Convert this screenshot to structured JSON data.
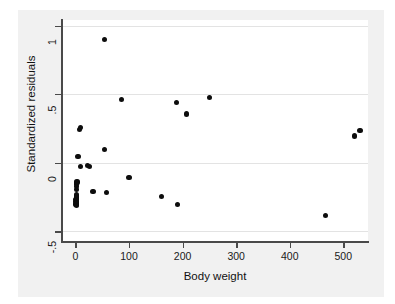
{
  "chart_data": {
    "type": "scatter",
    "title": "",
    "xlabel": "Body weight",
    "ylabel": "Standardized residuals",
    "xlim": [
      -25,
      546
    ],
    "ylim": [
      -0.57,
      1.04
    ],
    "xticks": [
      0,
      100,
      200,
      300,
      400,
      500
    ],
    "xtick_labels": [
      "0",
      "100",
      "200",
      "300",
      "400",
      "500"
    ],
    "yticks": [
      -0.5,
      0,
      0.5,
      1
    ],
    "ytick_labels": [
      "-.5",
      "0",
      ".5",
      "1"
    ],
    "grid": "horizontal",
    "legend": "none",
    "marker": "filled-circle",
    "marker_color": "#0d0d0d",
    "points": [
      {
        "x": 1,
        "y": -0.27
      },
      {
        "x": 1,
        "y": -0.28
      },
      {
        "x": 1.5,
        "y": -0.25
      },
      {
        "x": 1.5,
        "y": -0.255
      },
      {
        "x": 2,
        "y": -0.245
      },
      {
        "x": 2,
        "y": -0.26
      },
      {
        "x": 2.5,
        "y": -0.235
      },
      {
        "x": 1.2,
        "y": -0.3
      },
      {
        "x": 2.2,
        "y": -0.29
      },
      {
        "x": 1.8,
        "y": -0.31
      },
      {
        "x": 2.0,
        "y": -0.155
      },
      {
        "x": 2.2,
        "y": -0.175
      },
      {
        "x": 2.5,
        "y": -0.195
      },
      {
        "x": 3.0,
        "y": -0.14
      },
      {
        "x": 5,
        "y": 0.045
      },
      {
        "x": 7,
        "y": 0.245
      },
      {
        "x": 9,
        "y": 0.255
      },
      {
        "x": 10,
        "y": -0.03
      },
      {
        "x": 22,
        "y": -0.02
      },
      {
        "x": 26,
        "y": -0.025
      },
      {
        "x": 33,
        "y": -0.21
      },
      {
        "x": 54,
        "y": 0.9
      },
      {
        "x": 55,
        "y": 0.095
      },
      {
        "x": 58,
        "y": -0.215
      },
      {
        "x": 86,
        "y": 0.46
      },
      {
        "x": 100,
        "y": -0.105
      },
      {
        "x": 160,
        "y": -0.245
      },
      {
        "x": 189,
        "y": 0.44
      },
      {
        "x": 191,
        "y": -0.305
      },
      {
        "x": 208,
        "y": 0.355
      },
      {
        "x": 250,
        "y": 0.475
      },
      {
        "x": 466,
        "y": -0.385
      },
      {
        "x": 521,
        "y": 0.195
      },
      {
        "x": 531,
        "y": 0.235
      }
    ]
  }
}
